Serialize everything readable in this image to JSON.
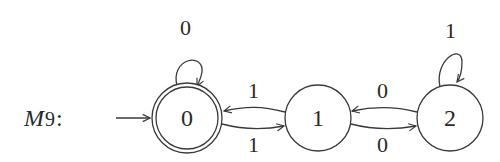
{
  "diagram": {
    "type": "finite-state-automaton",
    "machine_label": "M",
    "machine_subscript": "9",
    "machine_colon": ":",
    "start_state": "0",
    "states": [
      {
        "id": "0",
        "label": "0",
        "accepting": true
      },
      {
        "id": "1",
        "label": "1",
        "accepting": false
      },
      {
        "id": "2",
        "label": "2",
        "accepting": false
      }
    ],
    "transitions": [
      {
        "from": "0",
        "to": "0",
        "label": "0"
      },
      {
        "from": "1",
        "to": "0",
        "label": "1"
      },
      {
        "from": "0",
        "to": "1",
        "label": "1"
      },
      {
        "from": "2",
        "to": "1",
        "label": "0"
      },
      {
        "from": "1",
        "to": "2",
        "label": "0"
      },
      {
        "from": "2",
        "to": "2",
        "label": "1"
      }
    ]
  }
}
